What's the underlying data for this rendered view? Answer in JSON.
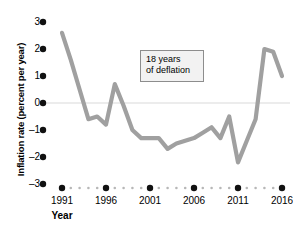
{
  "chart_data": {
    "type": "line",
    "title": "",
    "xlabel": "Year",
    "ylabel": "Inflation rate (percent per year)",
    "xlim": [
      1990,
      2016.5
    ],
    "ylim": [
      -3,
      3
    ],
    "grid": false,
    "zero_line": true,
    "legend": "none",
    "line_color": "#a0a0a0",
    "x": [
      1991,
      1992,
      1993,
      1994,
      1995,
      1996,
      1997,
      1998,
      1999,
      2000,
      2001,
      2002,
      2003,
      2004,
      2005,
      2006,
      2007,
      2008,
      2009,
      2010,
      2011,
      2012,
      2013,
      2014,
      2015,
      2016
    ],
    "values": [
      2.6,
      1.6,
      0.5,
      -0.6,
      -0.5,
      -0.8,
      0.7,
      -0.1,
      -1.0,
      -1.3,
      -1.3,
      -1.3,
      -1.7,
      -1.5,
      -1.4,
      -1.3,
      -1.1,
      -0.9,
      -1.3,
      -0.5,
      -2.2,
      -1.4,
      -0.6,
      2.0,
      1.9,
      1.0
    ],
    "annotations": [
      {
        "id": "deflation-note",
        "line1": "18 years",
        "line2": "of deflation",
        "x": 2001.5,
        "y": 1.6
      }
    ],
    "y_ticks": [
      3,
      2,
      1,
      0,
      -1,
      -2,
      -3
    ],
    "y_tick_labels": [
      "3",
      "2",
      "1",
      "0",
      "–1",
      "–2",
      "–3"
    ],
    "x_ticks": [
      1991,
      1996,
      2001,
      2006,
      2011,
      2016
    ],
    "x_tick_labels": [
      "1991",
      "1996",
      "2001",
      "2006",
      "2011",
      "2016"
    ],
    "x_minor_ticks": [
      1992,
      1993,
      1994,
      1995,
      1997,
      1998,
      1999,
      2000,
      2002,
      2003,
      2004,
      2005,
      2007,
      2008,
      2009,
      2010,
      2012,
      2013,
      2014,
      2015
    ],
    "tick_style": "dots",
    "colors": {
      "line": "#a0a0a0",
      "axis_dots": "#111111",
      "minor_dots": "#b7b7b7",
      "zero_line": "#d9d9d9",
      "annotation_bg": "#f2f2f2",
      "annotation_border": "#8d8d8d",
      "text": "#000000",
      "background": "#ffffff"
    }
  }
}
